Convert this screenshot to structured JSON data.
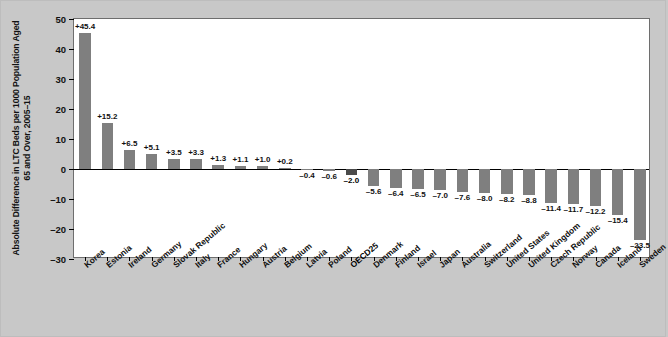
{
  "chart_data": {
    "type": "bar",
    "title": "",
    "xlabel": "",
    "ylabel": "Absolute Difference in LTC Beds per 1000 Population Aged 65 and Over, 2005–15",
    "ylim": [
      -30,
      50
    ],
    "yticks": [
      50,
      40,
      30,
      20,
      10,
      0,
      -10,
      -20,
      -30
    ],
    "ytick_labels": [
      "50",
      "40",
      "30",
      "20",
      "10",
      "0",
      "–10",
      "–20",
      "–30"
    ],
    "grid": false,
    "legend": "none",
    "highlight_category": "OECD25",
    "colors": {
      "bar": "#7f7f7f",
      "bar_highlight": "#4a4a4a",
      "plot_background": "#ffffff",
      "figure_background": "#c8c8c8",
      "axis": "#000000",
      "text": "#111111"
    },
    "categories": [
      "Korea",
      "Estonia",
      "Ireland",
      "Germany",
      "Slovak Republic",
      "Italy",
      "France",
      "Hungary",
      "Austria",
      "Belgium",
      "Latvia",
      "Poland",
      "OECD25",
      "Denmark",
      "Finland",
      "Israel",
      "Japan",
      "Australia",
      "Switzerland",
      "United States",
      "United Kingdom",
      "Czech Republic",
      "Norway",
      "Canada",
      "Iceland",
      "Sweden"
    ],
    "values": [
      45.4,
      15.2,
      6.5,
      5.1,
      3.5,
      3.3,
      1.3,
      1.1,
      1.0,
      0.2,
      0.1,
      -0.4,
      -2.0,
      -0.6,
      -5.6,
      -6.4,
      -6.5,
      -7.0,
      -7.6,
      -8.0,
      -8.2,
      -8.8,
      -11.4,
      -11.7,
      -12.2,
      -15.4
    ],
    "value_labels": [
      "+45.4",
      "+15.2",
      "+6.5",
      "+5.1",
      "+3.5",
      "+3.3",
      "+1.3",
      "+1.1",
      "+1.0",
      "+0.2",
      "",
      "–0.4",
      "–0.6",
      "–2.0",
      "–5.6",
      "–6.4",
      "–6.5",
      "–7.0",
      "–7.6",
      "–8.0",
      "–8.2",
      "–8.8",
      "–11.4",
      "–11.7",
      "–12.2",
      "–15.4",
      "–23.5"
    ],
    "bars": [
      {
        "category": "Korea",
        "value": 45.4,
        "label": "+45.4",
        "highlight": false
      },
      {
        "category": "Estonia",
        "value": 15.2,
        "label": "+15.2",
        "highlight": false
      },
      {
        "category": "Ireland",
        "value": 6.5,
        "label": "+6.5",
        "highlight": false
      },
      {
        "category": "Germany",
        "value": 5.1,
        "label": "+5.1",
        "highlight": false
      },
      {
        "category": "Slovak Republic",
        "value": 3.5,
        "label": "+3.5",
        "highlight": false
      },
      {
        "category": "Italy",
        "value": 3.3,
        "label": "+3.3",
        "highlight": false
      },
      {
        "category": "France",
        "value": 1.3,
        "label": "+1.3",
        "highlight": false
      },
      {
        "category": "Hungary",
        "value": 1.1,
        "label": "+1.1",
        "highlight": false
      },
      {
        "category": "Austria",
        "value": 1.0,
        "label": "+1.0",
        "highlight": false
      },
      {
        "category": "Belgium",
        "value": 0.2,
        "label": "+0.2",
        "highlight": false
      },
      {
        "category": "Latvia",
        "value": -0.4,
        "label": "–0.4",
        "highlight": false
      },
      {
        "category": "Poland",
        "value": -0.6,
        "label": "–0.6",
        "highlight": false
      },
      {
        "category": "OECD25",
        "value": -2.0,
        "label": "–2.0",
        "highlight": true
      },
      {
        "category": "Denmark",
        "value": -5.6,
        "label": "–5.6",
        "highlight": false
      },
      {
        "category": "Finland",
        "value": -6.4,
        "label": "–6.4",
        "highlight": false
      },
      {
        "category": "Israel",
        "value": -6.5,
        "label": "–6.5",
        "highlight": false
      },
      {
        "category": "Japan",
        "value": -7.0,
        "label": "–7.0",
        "highlight": false
      },
      {
        "category": "Australia",
        "value": -7.6,
        "label": "–7.6",
        "highlight": false
      },
      {
        "category": "Switzerland",
        "value": -8.0,
        "label": "–8.0",
        "highlight": false
      },
      {
        "category": "United States",
        "value": -8.2,
        "label": "–8.2",
        "highlight": false
      },
      {
        "category": "United Kingdom",
        "value": -8.8,
        "label": "–8.8",
        "highlight": false
      },
      {
        "category": "Czech Republic",
        "value": -11.4,
        "label": "–11.4",
        "highlight": false
      },
      {
        "category": "Norway",
        "value": -11.7,
        "label": "–11.7",
        "highlight": false
      },
      {
        "category": "Canada",
        "value": -12.2,
        "label": "–12.2",
        "highlight": false
      },
      {
        "category": "Iceland",
        "value": -15.4,
        "label": "–15.4",
        "highlight": false
      },
      {
        "category": "Sweden",
        "value": -23.5,
        "label": "–23.5",
        "highlight": false
      }
    ]
  }
}
